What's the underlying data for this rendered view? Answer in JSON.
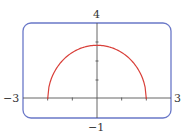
{
  "chart_data": {
    "type": "line",
    "title": "",
    "xlabel": "",
    "ylabel": "",
    "xlim": [
      -3,
      3
    ],
    "ylim": [
      -1,
      4
    ],
    "grid": false,
    "legend": null,
    "tick_labels": {
      "x_min": "−3",
      "x_max": "3",
      "y_min": "−1",
      "y_max": "4"
    },
    "x_ticks": [
      -2,
      -1,
      1,
      2
    ],
    "y_ticks": [
      1,
      2,
      3
    ],
    "series": [
      {
        "name": "upper half curve",
        "color": "#d9403a",
        "x": [
          -2,
          -1.75,
          -1.5,
          -1,
          -0.5,
          0,
          0.5,
          1,
          1.5,
          1.75,
          2
        ],
        "y": [
          0,
          1.37,
          1.87,
          2.45,
          2.74,
          2.83,
          2.74,
          2.45,
          1.87,
          1.37,
          0
        ]
      }
    ]
  },
  "style": {
    "frame_color": "#6a78c8",
    "axis_color": "#555555",
    "curve_color": "#d9403a"
  }
}
